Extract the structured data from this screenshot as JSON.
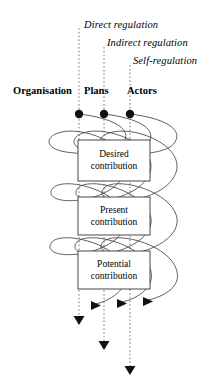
{
  "diagram": {
    "type": "spiral-regulation-diagram",
    "background_color": "#ffffff",
    "stroke_color": "#333333",
    "text_color": "#000000",
    "regulation_labels": [
      {
        "text": "Direct regulation",
        "x": 84,
        "y": 20
      },
      {
        "text": "Indirect regulation",
        "x": 107,
        "y": 38
      },
      {
        "text": "Self-regulation",
        "x": 133,
        "y": 56
      }
    ],
    "column_labels": [
      {
        "text": "Organisation",
        "x": 13,
        "y": 86
      },
      {
        "text": "Plans",
        "x": 84,
        "y": 86
      },
      {
        "text": "Actors",
        "x": 127,
        "y": 86
      }
    ],
    "nodes": [
      {
        "name": "plans-node-left",
        "cx": 79,
        "cy": 114,
        "r": 4.2,
        "color": "#111111"
      },
      {
        "name": "plans-node-middle",
        "cx": 104,
        "cy": 114,
        "r": 4.2,
        "color": "#111111"
      },
      {
        "name": "actors-node-right",
        "cx": 130,
        "cy": 114,
        "r": 4.2,
        "color": "#111111"
      }
    ],
    "boxes": [
      {
        "name": "desired-contribution-box",
        "line1": "Desired",
        "line2": "contribution",
        "x": 78,
        "y": 140,
        "w": 72,
        "h": 41
      },
      {
        "name": "present-contribution-box",
        "line1": "Present",
        "line2": "contribution",
        "x": 78,
        "y": 197,
        "w": 72,
        "h": 38
      },
      {
        "name": "potential-contribution-box",
        "line1": "Potential",
        "line2": "contribution",
        "x": 78,
        "y": 251,
        "w": 72,
        "h": 38
      }
    ],
    "dashed_lines": [
      {
        "name": "direct-regulation-line",
        "x": 79,
        "y_start": 28,
        "y_end": 316
      },
      {
        "name": "indirect-regulation-line",
        "x": 104,
        "y_start": 47,
        "y_end": 341
      },
      {
        "name": "self-regulation-line",
        "x": 130,
        "y_start": 65,
        "y_end": 366
      }
    ],
    "down_arrows": [
      {
        "name": "direct-regulation-arrow",
        "x": 79,
        "y": 322
      },
      {
        "name": "indirect-regulation-arrow",
        "x": 104,
        "y": 347
      },
      {
        "name": "self-regulation-arrow",
        "x": 130,
        "y": 372
      }
    ],
    "spiral_arrows": [
      {
        "name": "organisation-spiral-arrow",
        "x": 96,
        "y": 305
      },
      {
        "name": "plans-spiral-arrow",
        "x": 122,
        "y": 303
      },
      {
        "name": "actors-spiral-arrow",
        "x": 148,
        "y": 301
      }
    ],
    "spirals": [
      {
        "name": "organisation-spiral",
        "offset": 0
      },
      {
        "name": "plans-spiral",
        "offset": 25
      },
      {
        "name": "actors-spiral",
        "offset": 51
      }
    ]
  }
}
